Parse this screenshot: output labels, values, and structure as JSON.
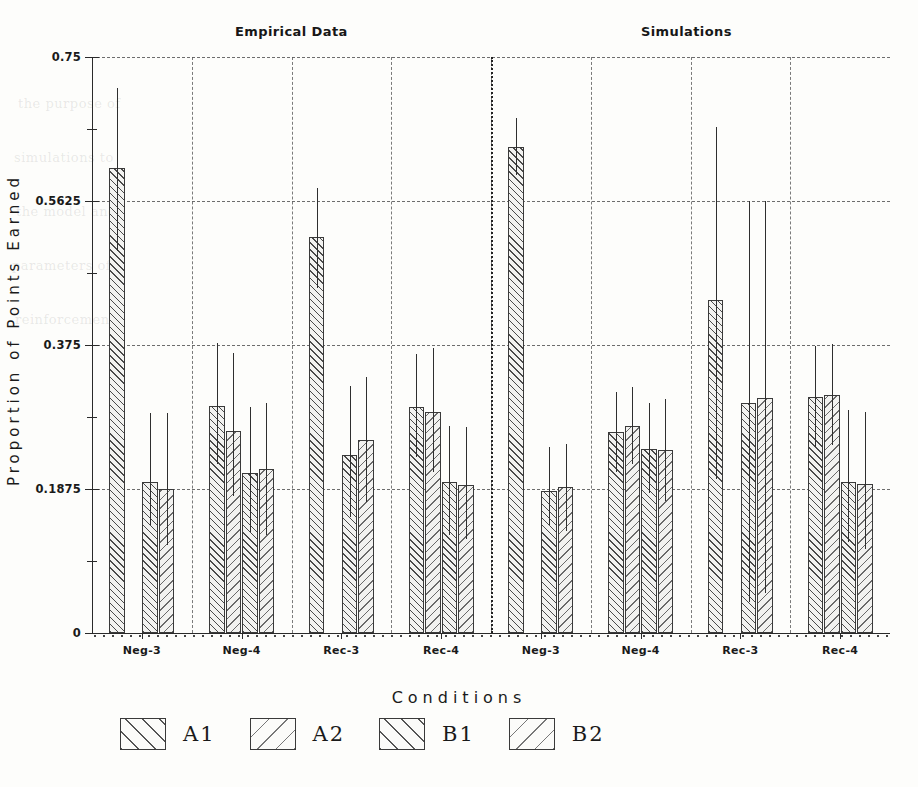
{
  "figure": {
    "y_axis_title": "Proportion of Points Earned",
    "x_axis_title": "Conditions",
    "panels": [
      {
        "key": "empirical",
        "title": "Empirical Data"
      },
      {
        "key": "simulations",
        "title": "Simulations"
      }
    ]
  },
  "y_ticks": [
    {
      "value": 0,
      "label": "0"
    },
    {
      "value": 0.1875,
      "label": "0.1875"
    },
    {
      "value": 0.375,
      "label": "0.375"
    },
    {
      "value": 0.5625,
      "label": "0.5625"
    },
    {
      "value": 0.75,
      "label": "0.75"
    }
  ],
  "y_minor_ticks": [
    0.09375,
    0.28125,
    0.46875,
    0.65625
  ],
  "legend": {
    "items": [
      {
        "label": "A1",
        "hatch": "forward"
      },
      {
        "label": "A2",
        "hatch": "backward"
      },
      {
        "label": "B1",
        "hatch": "forward"
      },
      {
        "label": "B2",
        "hatch": "backward"
      }
    ]
  },
  "chart_data": {
    "type": "bar",
    "title": "",
    "xlabel": "Conditions",
    "ylabel": "Proportion of Points Earned",
    "ylim": [
      0,
      0.75
    ],
    "yticks": [
      0,
      0.1875,
      0.375,
      0.5625,
      0.75
    ],
    "grid": "dashed horizontal and vertical",
    "legend_position": "below plot, horizontal",
    "categories": [
      "Neg-3",
      "Neg-4",
      "Rec-3",
      "Rec-4"
    ],
    "panels": [
      "Empirical Data",
      "Simulations"
    ],
    "series_names": [
      "A1",
      "A2",
      "B1",
      "B2"
    ],
    "error_bars": "upper and lower whiskers (no caps)",
    "panel_data": [
      {
        "panel": "Empirical Data",
        "groups": [
          {
            "category": "Neg-3",
            "bars": [
              {
                "series": "A1",
                "value": 0.605,
                "err_high": 0.71,
                "err_low": 0.497
              },
              {
                "series": "A2",
                "value": 0.0,
                "err_high": 0.0,
                "err_low": 0.0
              },
              {
                "series": "B1",
                "value": 0.196,
                "err_high": 0.287,
                "err_low": 0.14
              },
              {
                "series": "B2",
                "value": 0.188,
                "err_high": 0.286,
                "err_low": 0.115
              }
            ]
          },
          {
            "category": "Neg-4",
            "bars": [
              {
                "series": "A1",
                "value": 0.296,
                "err_high": 0.378,
                "err_low": 0.22
              },
              {
                "series": "A2",
                "value": 0.263,
                "err_high": 0.364,
                "err_low": 0.179
              },
              {
                "series": "B1",
                "value": 0.209,
                "err_high": 0.294,
                "err_low": 0.131
              },
              {
                "series": "B2",
                "value": 0.213,
                "err_high": 0.3,
                "err_low": 0.128
              }
            ]
          },
          {
            "category": "Rec-3",
            "bars": [
              {
                "series": "A1",
                "value": 0.516,
                "err_high": 0.58,
                "err_low": 0.449
              },
              {
                "series": "A2",
                "value": 0.0,
                "err_high": 0.0,
                "err_low": 0.0
              },
              {
                "series": "B1",
                "value": 0.232,
                "err_high": 0.322,
                "err_low": 0.151
              },
              {
                "series": "B2",
                "value": 0.251,
                "err_high": 0.333,
                "err_low": 0.17
              }
            ]
          },
          {
            "category": "Rec-4",
            "bars": [
              {
                "series": "A1",
                "value": 0.294,
                "err_high": 0.363,
                "err_low": 0.229
              },
              {
                "series": "A2",
                "value": 0.288,
                "err_high": 0.371,
                "err_low": 0.21
              },
              {
                "series": "B1",
                "value": 0.197,
                "err_high": 0.27,
                "err_low": 0.128
              },
              {
                "series": "B2",
                "value": 0.193,
                "err_high": 0.268,
                "err_low": 0.122
              }
            ]
          }
        ]
      },
      {
        "panel": "Simulations",
        "groups": [
          {
            "category": "Neg-3",
            "bars": [
              {
                "series": "A1",
                "value": 0.633,
                "err_high": 0.67,
                "err_low": 0.596
              },
              {
                "series": "A2",
                "value": 0.0,
                "err_high": 0.0,
                "err_low": 0.0
              },
              {
                "series": "B1",
                "value": 0.185,
                "err_high": 0.242,
                "err_low": 0.14
              },
              {
                "series": "B2",
                "value": 0.19,
                "err_high": 0.246,
                "err_low": 0.133
              }
            ]
          },
          {
            "category": "Neg-4",
            "bars": [
              {
                "series": "A1",
                "value": 0.262,
                "err_high": 0.314,
                "err_low": 0.21
              },
              {
                "series": "A2",
                "value": 0.27,
                "err_high": 0.32,
                "err_low": 0.22
              },
              {
                "series": "B1",
                "value": 0.24,
                "err_high": 0.3,
                "err_low": 0.182
              },
              {
                "series": "B2",
                "value": 0.238,
                "err_high": 0.305,
                "err_low": 0.172
              }
            ]
          },
          {
            "category": "Rec-3",
            "bars": [
              {
                "series": "A1",
                "value": 0.434,
                "err_high": 0.659,
                "err_low": 0.2
              },
              {
                "series": "A2",
                "value": 0.0,
                "err_high": 0.0,
                "err_low": 0.0
              },
              {
                "series": "B1",
                "value": 0.3,
                "err_high": 0.562,
                "err_low": 0.04
              },
              {
                "series": "B2",
                "value": 0.306,
                "err_high": 0.562,
                "err_low": 0.052
              }
            ]
          },
          {
            "category": "Rec-4",
            "bars": [
              {
                "series": "A1",
                "value": 0.307,
                "err_high": 0.374,
                "err_low": 0.242
              },
              {
                "series": "A2",
                "value": 0.31,
                "err_high": 0.376,
                "err_low": 0.245
              },
              {
                "series": "B1",
                "value": 0.196,
                "err_high": 0.29,
                "err_low": 0.118
              },
              {
                "series": "B2",
                "value": 0.194,
                "err_high": 0.288,
                "err_low": 0.11
              }
            ]
          }
        ]
      }
    ]
  }
}
